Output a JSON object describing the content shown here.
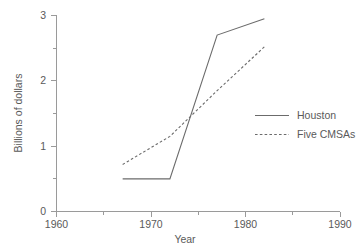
{
  "chart_data": {
    "type": "line",
    "title": "",
    "xlabel": "Year",
    "ylabel": "Billions of dollars",
    "xlim": [
      1960,
      1990
    ],
    "ylim": [
      0,
      3
    ],
    "grid": false,
    "legend_position": "center-right",
    "x_ticks": [
      1960,
      1970,
      1980,
      1990
    ],
    "x_tick_labels": [
      "1960",
      "1970",
      "1980",
      "1990"
    ],
    "x_minor_ticks": [
      1965,
      1975,
      1985
    ],
    "y_ticks": [
      0,
      1,
      2,
      3
    ],
    "y_tick_labels": [
      "0",
      "1",
      "2",
      "3"
    ],
    "y_minor_ticks": [
      0.5,
      1.5,
      2.5
    ],
    "series": [
      {
        "name": "Houston",
        "style": "solid",
        "color": "#6b6b6b",
        "x": [
          1967,
          1972,
          1977,
          1982
        ],
        "values": [
          0.5,
          0.5,
          2.7,
          2.95
        ]
      },
      {
        "name": "Five CMSAs",
        "style": "dashed",
        "color": "#6b6b6b",
        "x": [
          1967,
          1972,
          1977,
          1982
        ],
        "values": [
          0.72,
          1.15,
          1.85,
          2.52
        ]
      }
    ]
  },
  "axes": {
    "x_title": "Year",
    "y_title": "Billions of dollars",
    "x_tick_labels": [
      "1960",
      "1970",
      "1980",
      "1990"
    ],
    "y_tick_labels": [
      "0",
      "1",
      "2",
      "3"
    ]
  },
  "legend": {
    "entries": [
      {
        "label": "Houston",
        "style": "solid"
      },
      {
        "label": "Five CMSAs",
        "style": "dashed"
      }
    ]
  }
}
